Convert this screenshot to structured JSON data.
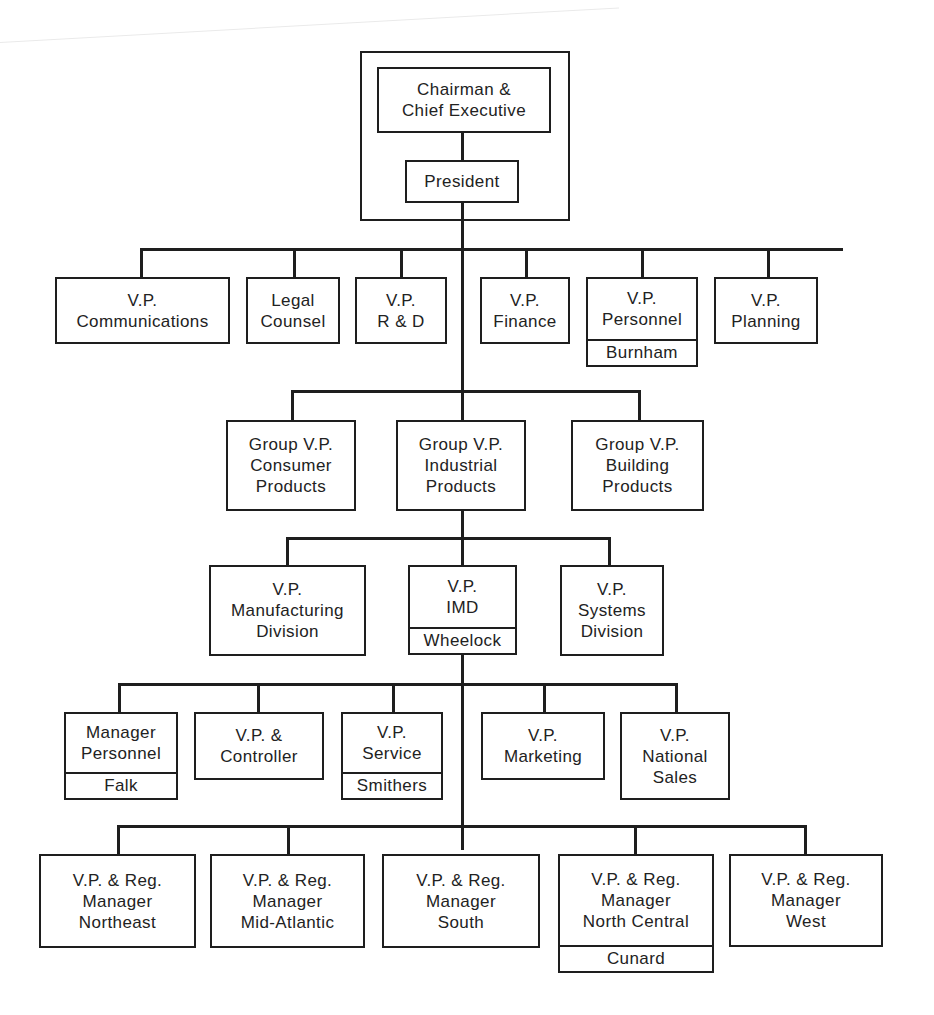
{
  "executive": {
    "chairman": [
      "Chairman &",
      "Chief Executive"
    ],
    "president": [
      "President"
    ]
  },
  "staff": [
    {
      "lines": [
        "V.P.",
        "Communications"
      ]
    },
    {
      "lines": [
        "Legal",
        "Counsel"
      ]
    },
    {
      "lines": [
        "V.P.",
        "R & D"
      ]
    },
    {
      "lines": [
        "V.P.",
        "Finance"
      ]
    },
    {
      "lines": [
        "V.P.",
        "Personnel"
      ],
      "name": "Burnham"
    },
    {
      "lines": [
        "V.P.",
        "Planning"
      ]
    }
  ],
  "groups": [
    {
      "lines": [
        "Group V.P.",
        "Consumer",
        "Products"
      ]
    },
    {
      "lines": [
        "Group V.P.",
        "Industrial",
        "Products"
      ]
    },
    {
      "lines": [
        "Group V.P.",
        "Building",
        "Products"
      ]
    }
  ],
  "divisions": [
    {
      "lines": [
        "V.P.",
        "Manufacturing",
        "Division"
      ]
    },
    {
      "lines": [
        "V.P.",
        "IMD"
      ],
      "name": "Wheelock"
    },
    {
      "lines": [
        "V.P.",
        "Systems",
        "Division"
      ]
    }
  ],
  "imd_staff": [
    {
      "lines": [
        "Manager",
        "Personnel"
      ],
      "name": "Falk"
    },
    {
      "lines": [
        "V.P. &",
        "Controller"
      ]
    },
    {
      "lines": [
        "V.P.",
        "Service"
      ],
      "name": "Smithers"
    },
    {
      "lines": [
        "V.P.",
        "Marketing"
      ]
    },
    {
      "lines": [
        "V.P.",
        "National",
        "Sales"
      ]
    }
  ],
  "regions": [
    {
      "lines": [
        "V.P. & Reg.",
        "Manager",
        "Northeast"
      ]
    },
    {
      "lines": [
        "V.P. & Reg.",
        "Manager",
        "Mid-Atlantic"
      ]
    },
    {
      "lines": [
        "V.P. & Reg.",
        "Manager",
        "South"
      ]
    },
    {
      "lines": [
        "V.P. & Reg.",
        "Manager",
        "North Central"
      ],
      "name": "Cunard"
    },
    {
      "lines": [
        "V.P. & Reg.",
        "Manager",
        "West"
      ]
    }
  ]
}
